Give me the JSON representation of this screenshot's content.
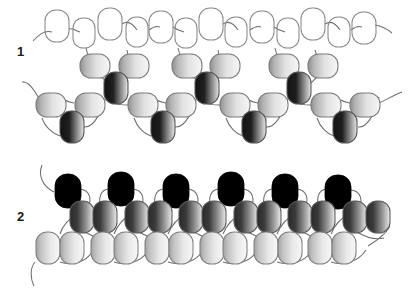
{
  "figure": {
    "background_color": "#ffffff",
    "width": 410,
    "height": 288,
    "caption_text": "",
    "panels": [
      {
        "id": "panel-1",
        "label": "1",
        "label_x": 17,
        "label_y": 45,
        "description": "Zig-zag two-start chain: open outlined units on the upper row, light-gradient units in the middle, dark-gradient units at the vertices.",
        "rows": [
          {
            "name": "outlined-row",
            "style": "outline",
            "fill_start": "#ffffff",
            "fill_end": "#ffffff",
            "stroke": "#8a8a8a",
            "units": [
              {
                "cx": 57,
                "cy": 26,
                "rx": 12,
                "ry": 16,
                "rot": 0
              },
              {
                "cx": 84,
                "cy": 33,
                "rx": 11,
                "ry": 15,
                "rot": 0
              },
              {
                "cx": 110,
                "cy": 24,
                "rx": 12,
                "ry": 16,
                "rot": 0
              },
              {
                "cx": 137,
                "cy": 32,
                "rx": 11,
                "ry": 15,
                "rot": 0
              },
              {
                "cx": 161,
                "cy": 27,
                "rx": 12,
                "ry": 16,
                "rot": 0
              },
              {
                "cx": 186,
                "cy": 33,
                "rx": 11,
                "ry": 15,
                "rot": 0
              },
              {
                "cx": 211,
                "cy": 24,
                "rx": 12,
                "ry": 16,
                "rot": 0
              },
              {
                "cx": 236,
                "cy": 32,
                "rx": 11,
                "ry": 15,
                "rot": 0
              },
              {
                "cx": 262,
                "cy": 27,
                "rx": 12,
                "ry": 16,
                "rot": 0
              },
              {
                "cx": 288,
                "cy": 33,
                "rx": 11,
                "ry": 15,
                "rot": 0
              },
              {
                "cx": 313,
                "cy": 24,
                "rx": 12,
                "ry": 16,
                "rot": 0
              },
              {
                "cx": 339,
                "cy": 32,
                "rx": 11,
                "ry": 15,
                "rot": 0
              },
              {
                "cx": 364,
                "cy": 28,
                "rx": 12,
                "ry": 16,
                "rot": 0
              }
            ]
          },
          {
            "name": "upper-light-row",
            "style": "light-gradient",
            "fill_start": "#9c9c9c",
            "fill_end": "#f2f2f2",
            "stroke": "#7c7c7c",
            "units": [
              {
                "cx": 95,
                "cy": 66,
                "rx": 15,
                "ry": 12,
                "rot": 0
              },
              {
                "cx": 134,
                "cy": 66,
                "rx": 15,
                "ry": 12,
                "rot": 0
              },
              {
                "cx": 187,
                "cy": 66,
                "rx": 15,
                "ry": 12,
                "rot": 0
              },
              {
                "cx": 225,
                "cy": 66,
                "rx": 15,
                "ry": 12,
                "rot": 0
              },
              {
                "cx": 284,
                "cy": 66,
                "rx": 15,
                "ry": 12,
                "rot": 0
              },
              {
                "cx": 323,
                "cy": 66,
                "rx": 15,
                "ry": 12,
                "rot": 0
              }
            ]
          },
          {
            "name": "upper-dark-vertices",
            "style": "dark-gradient",
            "fill_start": "#1c1c1c",
            "fill_end": "#d8d8d8",
            "stroke": "#555555",
            "units": [
              {
                "cx": 116,
                "cy": 88,
                "rx": 12,
                "ry": 16,
                "rot": 0
              },
              {
                "cx": 207,
                "cy": 88,
                "rx": 12,
                "ry": 16,
                "rot": 0
              },
              {
                "cx": 299,
                "cy": 88,
                "rx": 12,
                "ry": 16,
                "rot": 0
              }
            ]
          },
          {
            "name": "lower-light-row",
            "style": "light-gradient",
            "fill_start": "#9c9c9c",
            "fill_end": "#f2f2f2",
            "stroke": "#7c7c7c",
            "units": [
              {
                "cx": 51,
                "cy": 105,
                "rx": 15,
                "ry": 12,
                "rot": 0
              },
              {
                "cx": 90,
                "cy": 105,
                "rx": 15,
                "ry": 12,
                "rot": 0
              },
              {
                "cx": 143,
                "cy": 105,
                "rx": 15,
                "ry": 12,
                "rot": 0
              },
              {
                "cx": 181,
                "cy": 105,
                "rx": 15,
                "ry": 12,
                "rot": 0
              },
              {
                "cx": 235,
                "cy": 105,
                "rx": 15,
                "ry": 12,
                "rot": 0
              },
              {
                "cx": 273,
                "cy": 105,
                "rx": 15,
                "ry": 12,
                "rot": 0
              },
              {
                "cx": 326,
                "cy": 105,
                "rx": 15,
                "ry": 12,
                "rot": 0
              },
              {
                "cx": 365,
                "cy": 105,
                "rx": 15,
                "ry": 12,
                "rot": 0
              }
            ]
          },
          {
            "name": "lower-dark-vertices",
            "style": "dark-gradient",
            "fill_start": "#1c1c1c",
            "fill_end": "#d8d8d8",
            "stroke": "#555555",
            "units": [
              {
                "cx": 72,
                "cy": 127,
                "rx": 12,
                "ry": 16,
                "rot": 0
              },
              {
                "cx": 163,
                "cy": 127,
                "rx": 12,
                "ry": 16,
                "rot": 0
              },
              {
                "cx": 254,
                "cy": 127,
                "rx": 12,
                "ry": 16,
                "rot": 0
              },
              {
                "cx": 345,
                "cy": 127,
                "rx": 12,
                "ry": 16,
                "rot": 0
              }
            ]
          }
        ]
      },
      {
        "id": "panel-2",
        "label": "2",
        "label_x": 17,
        "label_y": 210,
        "description": "Compact three-layer stack: solid black units on top, dark-gradient pairs in the middle, light-gradient pairs at the bottom.",
        "rows": [
          {
            "name": "black-row",
            "style": "solid-black",
            "fill_start": "#000000",
            "fill_end": "#000000",
            "stroke": "#000000",
            "units": [
              {
                "cx": 68,
                "cy": 191,
                "rx": 13,
                "ry": 17,
                "rot": 0
              },
              {
                "cx": 121,
                "cy": 189,
                "rx": 13,
                "ry": 17,
                "rot": 0
              },
              {
                "cx": 176,
                "cy": 191,
                "rx": 13,
                "ry": 17,
                "rot": 0
              },
              {
                "cx": 231,
                "cy": 189,
                "rx": 13,
                "ry": 17,
                "rot": 0
              },
              {
                "cx": 285,
                "cy": 191,
                "rx": 13,
                "ry": 17,
                "rot": 0
              },
              {
                "cx": 338,
                "cy": 192,
                "rx": 13,
                "ry": 17,
                "rot": 0
              }
            ]
          },
          {
            "name": "dark-gradient-row",
            "style": "dark-gradient",
            "fill_start": "#242424",
            "fill_end": "#e0e0e0",
            "stroke": "#5a5a5a",
            "units": [
              {
                "cx": 82,
                "cy": 217,
                "rx": 12,
                "ry": 16,
                "rot": 0
              },
              {
                "cx": 105,
                "cy": 217,
                "rx": 12,
                "ry": 16,
                "rot": 0
              },
              {
                "cx": 137,
                "cy": 217,
                "rx": 12,
                "ry": 16,
                "rot": 0
              },
              {
                "cx": 160,
                "cy": 217,
                "rx": 12,
                "ry": 16,
                "rot": 0
              },
              {
                "cx": 191,
                "cy": 217,
                "rx": 12,
                "ry": 16,
                "rot": 0
              },
              {
                "cx": 214,
                "cy": 217,
                "rx": 12,
                "ry": 16,
                "rot": 0
              },
              {
                "cx": 246,
                "cy": 217,
                "rx": 12,
                "ry": 16,
                "rot": 0
              },
              {
                "cx": 269,
                "cy": 217,
                "rx": 12,
                "ry": 16,
                "rot": 0
              },
              {
                "cx": 300,
                "cy": 217,
                "rx": 12,
                "ry": 16,
                "rot": 0
              },
              {
                "cx": 323,
                "cy": 217,
                "rx": 12,
                "ry": 16,
                "rot": 0
              },
              {
                "cx": 355,
                "cy": 217,
                "rx": 12,
                "ry": 16,
                "rot": 0
              },
              {
                "cx": 378,
                "cy": 217,
                "rx": 12,
                "ry": 16,
                "rot": 0
              }
            ]
          },
          {
            "name": "light-gradient-row",
            "style": "light-gradient",
            "fill_start": "#a8a8a8",
            "fill_end": "#f4f4f4",
            "stroke": "#808080",
            "units": [
              {
                "cx": 48,
                "cy": 248,
                "rx": 12,
                "ry": 16,
                "rot": 0
              },
              {
                "cx": 72,
                "cy": 248,
                "rx": 12,
                "ry": 16,
                "rot": 0
              },
              {
                "cx": 103,
                "cy": 248,
                "rx": 12,
                "ry": 16,
                "rot": 0
              },
              {
                "cx": 126,
                "cy": 248,
                "rx": 12,
                "ry": 16,
                "rot": 0
              },
              {
                "cx": 157,
                "cy": 248,
                "rx": 12,
                "ry": 16,
                "rot": 0
              },
              {
                "cx": 181,
                "cy": 248,
                "rx": 12,
                "ry": 16,
                "rot": 0
              },
              {
                "cx": 212,
                "cy": 248,
                "rx": 12,
                "ry": 16,
                "rot": 0
              },
              {
                "cx": 235,
                "cy": 248,
                "rx": 12,
                "ry": 16,
                "rot": 0
              },
              {
                "cx": 266,
                "cy": 248,
                "rx": 12,
                "ry": 16,
                "rot": 0
              },
              {
                "cx": 290,
                "cy": 248,
                "rx": 12,
                "ry": 16,
                "rot": 0
              },
              {
                "cx": 320,
                "cy": 248,
                "rx": 12,
                "ry": 16,
                "rot": 0
              },
              {
                "cx": 344,
                "cy": 248,
                "rx": 12,
                "ry": 16,
                "rot": 0
              }
            ]
          }
        ]
      }
    ],
    "colors": {
      "outline_stroke": "#8a8a8a",
      "linker_stroke": "#6e6e6e",
      "light_gradient_start": "#9c9c9c",
      "light_gradient_end": "#f2f2f2",
      "dark_gradient_start": "#1c1c1c",
      "dark_gradient_end": "#d8d8d8",
      "black_fill": "#000000",
      "label_color": "#1a1a1a"
    }
  }
}
